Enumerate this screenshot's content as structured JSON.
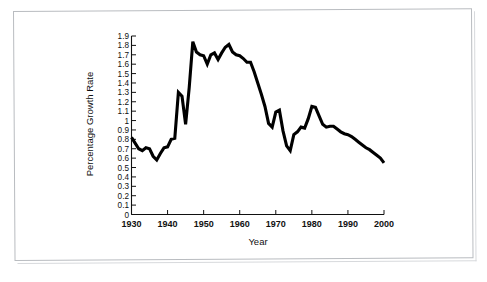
{
  "figure": {
    "kind": "line-chart",
    "background_color": "#ffffff",
    "frame_color": "#b9bcc0"
  },
  "chart_data": {
    "type": "line",
    "title": "",
    "xlabel": "Year",
    "ylabel": "Percentage Growth Rate",
    "xlim": [
      1930,
      2000
    ],
    "ylim": [
      0,
      1.9
    ],
    "grid": false,
    "legend": null,
    "line_color": "#000000",
    "x_ticks": [
      1930,
      1940,
      1950,
      1960,
      1970,
      1980,
      1990,
      2000
    ],
    "x_tick_labels": [
      "1930",
      "1940",
      "1950",
      "1960",
      "1970",
      "1980",
      "1990",
      "2000"
    ],
    "y_ticks": [
      0,
      0.1,
      0.2,
      0.3,
      0.4,
      0.5,
      0.6,
      0.7,
      0.8,
      0.9,
      1,
      1.1,
      1.2,
      1.3,
      1.4,
      1.5,
      1.6,
      1.7,
      1.8,
      1.9
    ],
    "y_tick_labels": [
      "0",
      "0.1",
      "0.2",
      "0.3",
      "0.4",
      "0.5",
      "0.6",
      "0.7",
      "0.8",
      "0.9",
      "1",
      "1.1",
      "1.2",
      "1.3",
      "1.4",
      "1.5",
      "1.6",
      "1.7",
      "1.8",
      "1.9"
    ],
    "x": [
      1930,
      1931,
      1932,
      1933,
      1934,
      1935,
      1936,
      1937,
      1938,
      1939,
      1940,
      1941,
      1942,
      1943,
      1944,
      1945,
      1946,
      1947,
      1948,
      1949,
      1950,
      1951,
      1952,
      1953,
      1954,
      1955,
      1956,
      1957,
      1958,
      1959,
      1960,
      1961,
      1962,
      1963,
      1964,
      1965,
      1966,
      1967,
      1968,
      1969,
      1970,
      1971,
      1972,
      1973,
      1974,
      1975,
      1976,
      1977,
      1978,
      1979,
      1980,
      1981,
      1982,
      1983,
      1984,
      1985,
      1986,
      1987,
      1988,
      1989,
      1990,
      1991,
      1992,
      1993,
      1994,
      1995,
      1996,
      1997,
      1998,
      1999,
      2000
    ],
    "values": [
      0.82,
      0.76,
      0.7,
      0.68,
      0.71,
      0.7,
      0.62,
      0.58,
      0.65,
      0.71,
      0.72,
      0.8,
      0.81,
      1.3,
      1.26,
      0.96,
      1.35,
      1.84,
      1.73,
      1.7,
      1.69,
      1.6,
      1.7,
      1.72,
      1.65,
      1.72,
      1.78,
      1.81,
      1.73,
      1.7,
      1.69,
      1.66,
      1.62,
      1.62,
      1.52,
      1.4,
      1.28,
      1.15,
      0.97,
      0.93,
      1.09,
      1.11,
      0.89,
      0.73,
      0.68,
      0.85,
      0.88,
      0.93,
      0.92,
      1.02,
      1.15,
      1.14,
      1.05,
      0.96,
      0.93,
      0.94,
      0.94,
      0.91,
      0.88,
      0.86,
      0.85,
      0.83,
      0.8,
      0.77,
      0.74,
      0.71,
      0.69,
      0.66,
      0.63,
      0.6,
      0.55
    ],
    "series_name": "percentage-growth-rate",
    "notes": {
      "peak_value": 1.84,
      "peak_year": 1947,
      "min_value": 0.55,
      "min_year": 2000,
      "early_min_value": 0.58,
      "early_min_year": 1937
    }
  }
}
